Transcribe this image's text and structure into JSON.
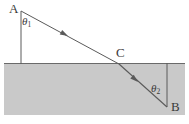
{
  "figure": {
    "colors": {
      "line": "#5a5a5a",
      "medium_fill": "#c9c9c9",
      "background": "#ffffff",
      "label": "#3a3a3a"
    },
    "medium": {
      "x": 4,
      "y": 64,
      "width": 181,
      "height": 51
    },
    "interface": {
      "x1": 4,
      "y1": 63.5,
      "x2": 185,
      "y2": 63.5
    },
    "normal_upper": {
      "x1": 21,
      "y1": 11,
      "x2": 21,
      "y2": 64
    },
    "normal_lower": {
      "x1": 167,
      "y1": 63,
      "x2": 167,
      "y2": 107
    },
    "incident_ray": {
      "x1": 21,
      "y1": 11,
      "x2": 119,
      "y2": 64,
      "arrow_at": {
        "x": 68,
        "y": 36
      }
    },
    "refracted_ray": {
      "x1": 119,
      "y1": 64,
      "x2": 167,
      "y2": 107,
      "arrow_at": {
        "x": 138,
        "y": 82
      }
    },
    "labels": {
      "point_a": "A",
      "point_b": "B",
      "point_c": "C",
      "theta1": "θ",
      "theta1_sub": "1",
      "theta2": "θ",
      "theta2_sub": "2"
    }
  }
}
